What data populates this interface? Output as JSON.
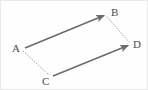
{
  "figure": {
    "type": "vector-parallelogram-diagram",
    "width": 148,
    "height": 90,
    "background_color": "#fefefe",
    "border_color": "#e9e9e9",
    "stroke_color": "#6b6b6b",
    "dotted_color": "#a8a8a8",
    "label_color": "#4a4a4a",
    "points": {
      "A": {
        "label": "A",
        "x": 22,
        "y": 48
      },
      "B": {
        "label": "B",
        "x": 106,
        "y": 13
      },
      "C": {
        "label": "C",
        "x": 50,
        "y": 76
      },
      "D": {
        "label": "D",
        "x": 129,
        "y": 43
      }
    },
    "solid_arrows": [
      {
        "name": "vector-AB",
        "from": "A",
        "to": "B",
        "x1": 24,
        "y1": 47,
        "x2": 104,
        "y2": 14
      },
      {
        "name": "vector-CD",
        "from": "C",
        "to": "D",
        "x1": 52,
        "y1": 75,
        "x2": 128,
        "y2": 44
      }
    ],
    "dotted_lines": [
      {
        "name": "segment-AC",
        "from": "A",
        "to": "C",
        "x1": 22,
        "y1": 50,
        "x2": 48,
        "y2": 74
      },
      {
        "name": "segment-BD",
        "from": "B",
        "to": "D",
        "x1": 106,
        "y1": 16,
        "x2": 128,
        "y2": 41
      }
    ]
  }
}
